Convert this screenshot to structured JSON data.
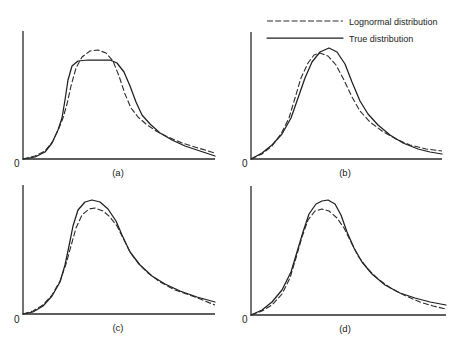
{
  "legend": {
    "items": [
      {
        "label": "Lognormal distribution",
        "style": "dashed"
      },
      {
        "label": "True distribution",
        "style": "solid"
      }
    ]
  },
  "chart_data": [
    {
      "type": "line",
      "panel_label": "(a)",
      "origin_label": "0",
      "title": "",
      "xlabel": "",
      "ylabel": "",
      "grid": false,
      "axis_px": {
        "x0": 23,
        "y0": 159,
        "x1": 215,
        "ytop": 31
      },
      "series": [
        {
          "name": "True distribution",
          "style": "solid",
          "points": [
            [
              23,
              159
            ],
            [
              35,
              157
            ],
            [
              45,
              152
            ],
            [
              52,
              143
            ],
            [
              58,
              130
            ],
            [
              62,
              118
            ],
            [
              65,
              100
            ],
            [
              68,
              80
            ],
            [
              72,
              66
            ],
            [
              78,
              61
            ],
            [
              88,
              60
            ],
            [
              100,
              60
            ],
            [
              110,
              60
            ],
            [
              117,
              63
            ],
            [
              124,
              72
            ],
            [
              130,
              86
            ],
            [
              136,
              102
            ],
            [
              142,
              115
            ],
            [
              150,
              124
            ],
            [
              160,
              133
            ],
            [
              172,
              140
            ],
            [
              185,
              146
            ],
            [
              200,
              151
            ],
            [
              215,
              156
            ]
          ]
        },
        {
          "name": "Lognormal distribution",
          "style": "dashed",
          "points": [
            [
              23,
              159
            ],
            [
              35,
              156
            ],
            [
              45,
              151
            ],
            [
              53,
              141
            ],
            [
              59,
              128
            ],
            [
              63,
              118
            ],
            [
              67,
              104
            ],
            [
              71,
              86
            ],
            [
              76,
              68
            ],
            [
              82,
              57
            ],
            [
              90,
              51
            ],
            [
              98,
              50
            ],
            [
              106,
              53
            ],
            [
              113,
              61
            ],
            [
              119,
              76
            ],
            [
              125,
              94
            ],
            [
              131,
              108
            ],
            [
              138,
              117
            ],
            [
              146,
              124
            ],
            [
              156,
              131
            ],
            [
              168,
              137
            ],
            [
              182,
              143
            ],
            [
              198,
              148
            ],
            [
              215,
              153
            ]
          ]
        }
      ]
    },
    {
      "type": "line",
      "panel_label": "(b)",
      "origin_label": "0",
      "title": "",
      "xlabel": "",
      "ylabel": "",
      "grid": false,
      "axis_px": {
        "x0": 251,
        "y0": 159,
        "x1": 442,
        "ytop": 32
      },
      "series": [
        {
          "name": "True distribution",
          "style": "solid",
          "points": [
            [
              251,
              159
            ],
            [
              262,
              153
            ],
            [
              272,
              145
            ],
            [
              282,
              134
            ],
            [
              291,
              118
            ],
            [
              298,
              98
            ],
            [
              305,
              78
            ],
            [
              312,
              62
            ],
            [
              320,
              52
            ],
            [
              329,
              48
            ],
            [
              337,
              52
            ],
            [
              345,
              64
            ],
            [
              352,
              82
            ],
            [
              360,
              101
            ],
            [
              368,
              114
            ],
            [
              378,
              125
            ],
            [
              390,
              135
            ],
            [
              403,
              143
            ],
            [
              418,
              149
            ],
            [
              430,
              152
            ],
            [
              442,
              154
            ]
          ]
        },
        {
          "name": "Lognormal distribution",
          "style": "dashed",
          "points": [
            [
              251,
              159
            ],
            [
              262,
              154
            ],
            [
              272,
              146
            ],
            [
              281,
              134
            ],
            [
              289,
              118
            ],
            [
              295,
              98
            ],
            [
              301,
              78
            ],
            [
              308,
              63
            ],
            [
              314,
              55
            ],
            [
              320,
              53
            ],
            [
              328,
              56
            ],
            [
              336,
              65
            ],
            [
              344,
              80
            ],
            [
              352,
              97
            ],
            [
              360,
              111
            ],
            [
              370,
              122
            ],
            [
              382,
              131
            ],
            [
              396,
              139
            ],
            [
              410,
              145
            ],
            [
              426,
              149
            ],
            [
              442,
              151
            ]
          ]
        }
      ]
    },
    {
      "type": "line",
      "panel_label": "(c)",
      "origin_label": "0",
      "title": "",
      "xlabel": "",
      "ylabel": "",
      "grid": false,
      "axis_px": {
        "x0": 23,
        "y0": 314,
        "x1": 215,
        "ytop": 185
      },
      "series": [
        {
          "name": "True distribution",
          "style": "solid",
          "points": [
            [
              23,
              314
            ],
            [
              33,
              312
            ],
            [
              43,
              306
            ],
            [
              52,
              296
            ],
            [
              60,
              282
            ],
            [
              65,
              265
            ],
            [
              69,
              246
            ],
            [
              73,
              226
            ],
            [
              78,
              210
            ],
            [
              85,
              202
            ],
            [
              92,
              200
            ],
            [
              100,
              202
            ],
            [
              108,
              209
            ],
            [
              116,
              221
            ],
            [
              122,
              235
            ],
            [
              130,
              252
            ],
            [
              140,
              265
            ],
            [
              152,
              276
            ],
            [
              165,
              284
            ],
            [
              180,
              291
            ],
            [
              197,
              297
            ],
            [
              215,
              302
            ]
          ]
        },
        {
          "name": "Lognormal distribution",
          "style": "dashed",
          "points": [
            [
              23,
              314
            ],
            [
              33,
              311
            ],
            [
              43,
              305
            ],
            [
              52,
              295
            ],
            [
              60,
              281
            ],
            [
              66,
              264
            ],
            [
              71,
              246
            ],
            [
              76,
              228
            ],
            [
              82,
              215
            ],
            [
              89,
              209
            ],
            [
              95,
              208
            ],
            [
              103,
              211
            ],
            [
              110,
              217
            ],
            [
              117,
              226
            ],
            [
              123,
              238
            ],
            [
              130,
              252
            ],
            [
              138,
              263
            ],
            [
              148,
              273
            ],
            [
              160,
              282
            ],
            [
              175,
              290
            ],
            [
              195,
              297
            ],
            [
              215,
              305
            ]
          ]
        }
      ]
    },
    {
      "type": "line",
      "panel_label": "(d)",
      "origin_label": "0",
      "title": "",
      "xlabel": "",
      "ylabel": "",
      "grid": false,
      "axis_px": {
        "x0": 251,
        "y0": 315,
        "x1": 446,
        "ytop": 186
      },
      "series": [
        {
          "name": "True distribution",
          "style": "solid",
          "points": [
            [
              251,
              315
            ],
            [
              262,
              310
            ],
            [
              272,
              302
            ],
            [
              282,
              290
            ],
            [
              291,
              272
            ],
            [
              297,
              252
            ],
            [
              303,
              232
            ],
            [
              309,
              214
            ],
            [
              316,
              204
            ],
            [
              322,
              201
            ],
            [
              328,
              200
            ],
            [
              335,
              204
            ],
            [
              341,
              215
            ],
            [
              347,
              232
            ],
            [
              354,
              248
            ],
            [
              362,
              262
            ],
            [
              372,
              274
            ],
            [
              385,
              285
            ],
            [
              400,
              293
            ],
            [
              415,
              298
            ],
            [
              430,
              302
            ],
            [
              446,
              305
            ]
          ]
        },
        {
          "name": "Lognormal distribution",
          "style": "dashed",
          "points": [
            [
              251,
              315
            ],
            [
              262,
              311
            ],
            [
              272,
              305
            ],
            [
              282,
              294
            ],
            [
              290,
              278
            ],
            [
              296,
              258
            ],
            [
              302,
              237
            ],
            [
              308,
              220
            ],
            [
              315,
              211
            ],
            [
              322,
              209
            ],
            [
              329,
              211
            ],
            [
              337,
              218
            ],
            [
              344,
              228
            ],
            [
              351,
              242
            ],
            [
              358,
              256
            ],
            [
              367,
              268
            ],
            [
              378,
              279
            ],
            [
              392,
              289
            ],
            [
              406,
              296
            ],
            [
              420,
              302
            ],
            [
              433,
              306
            ],
            [
              446,
              309
            ]
          ]
        }
      ]
    }
  ]
}
